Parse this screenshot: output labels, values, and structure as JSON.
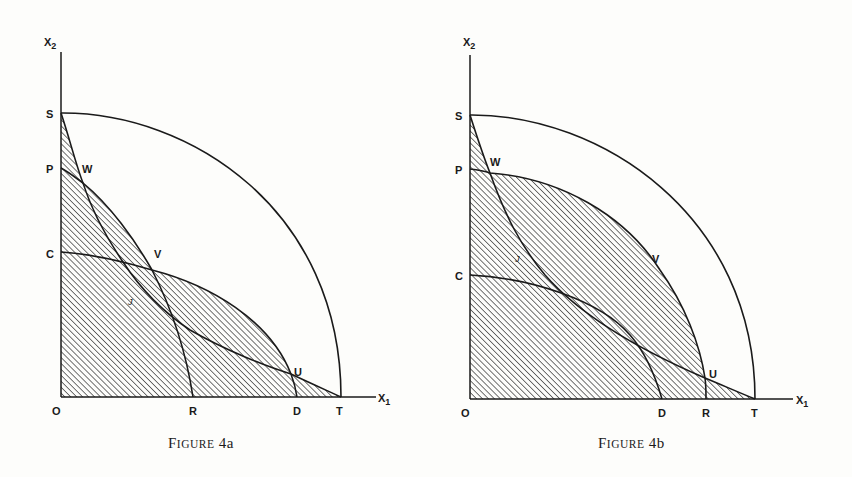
{
  "figures": [
    {
      "caption_first": "F",
      "caption_small": "IGURE",
      "caption_num": "4a",
      "axis_y_label": "X",
      "axis_y_sub": "2",
      "axis_x_label": "X",
      "axis_x_sub": "1",
      "points": {
        "S": "S",
        "P": "P",
        "C": "C",
        "O": "O",
        "W": "W",
        "V": "V",
        "J": "J",
        "U": "U",
        "R": "R",
        "D": "D",
        "T": "T"
      }
    },
    {
      "caption_first": "F",
      "caption_small": "IGURE",
      "caption_num": "4b",
      "axis_y_label": "X",
      "axis_y_sub": "2",
      "axis_x_label": "X",
      "axis_x_sub": "1",
      "points": {
        "S": "S",
        "P": "P",
        "C": "C",
        "O": "O",
        "W": "W",
        "V": "V",
        "J": "J",
        "U": "U",
        "R": "R",
        "D": "D",
        "T": "T"
      }
    }
  ],
  "colors": {
    "ink": "#1a1a1a",
    "paper": "#fdfdfb"
  }
}
